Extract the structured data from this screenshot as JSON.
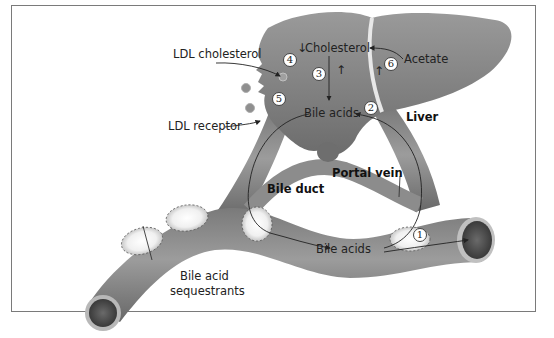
{
  "diagram": {
    "type": "enterohepatic circulation of bile acids",
    "organs": {
      "liver": "Liver",
      "portal_vein": "Portal vein",
      "bile_duct": "Bile duct"
    },
    "labels": {
      "ldl_cholesterol": "LDL cholesterol",
      "ldl_receptor": "LDL receptor",
      "cholesterol": "Cholesterol",
      "acetate": "Acetate",
      "bile_acids_liver": "Bile acids",
      "bile_acids_intestine": "Bile acids",
      "sequestrants_line1": "Bile acid",
      "sequestrants_line2": "sequestrants"
    },
    "indicators": {
      "cholesterol_down": "↓",
      "step3_up": "↑",
      "step6_up": "↑"
    },
    "steps": [
      "1",
      "2",
      "3",
      "4",
      "5",
      "6"
    ],
    "colors": {
      "organ_fill": "#8a8a8a",
      "organ_dark": "#5e5e5e",
      "frame": "#7a7a7a",
      "sequestrant_fill": "#f4f4f4",
      "text": "#222222"
    }
  }
}
